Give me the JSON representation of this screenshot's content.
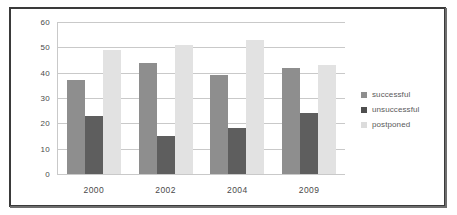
{
  "chart_data": {
    "type": "bar",
    "title": "",
    "subtitle": "",
    "xlabel": "",
    "ylabel": "",
    "categories": [
      "2000",
      "2002",
      "2004",
      "2009"
    ],
    "series": [
      {
        "name": "successful",
        "values": [
          37,
          44,
          39,
          42
        ],
        "color": "#8e8e8e"
      },
      {
        "name": "unsuccessful",
        "values": [
          23,
          15,
          18,
          24
        ],
        "color": "#5e5e5e"
      },
      {
        "name": "postponed",
        "values": [
          49,
          51,
          53,
          43
        ],
        "color": "#e2e2e2"
      }
    ],
    "ylim": [
      0,
      60
    ],
    "yticks": [
      0,
      10,
      20,
      30,
      40,
      50,
      60
    ],
    "ytick_labels": [
      "0",
      "10",
      "20",
      "30",
      "40",
      "50",
      "60"
    ],
    "grid": true,
    "legend_position": "right",
    "legend_entries": [
      "successful",
      "unsuccessful",
      "postponed"
    ]
  },
  "colors": {
    "successful": "#8e8e8e",
    "unsuccessful": "#5e5e5e",
    "postponed": "#e2e2e2",
    "gridline": "#c9c9c9",
    "frame": "#3a3a3a",
    "text": "#4a4a4a",
    "background": "#ffffff"
  }
}
